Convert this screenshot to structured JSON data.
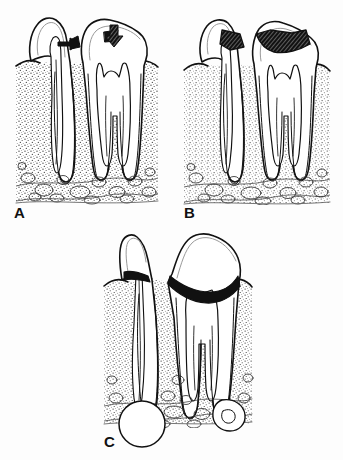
{
  "figure": {
    "background_color": "#fdfdfd",
    "line_color": "#111111",
    "caries_fill_color": "#111111",
    "bone_stipple_color": "#333333",
    "panels": [
      {
        "id": "A",
        "label": "A",
        "caption": "Incipient caries: shallow enamel and dentin lesions indicated by arrows; pulp chamber intact",
        "teeth_count": 2,
        "annotations": [
          {
            "name": "arrow-right",
            "direction": "right",
            "target": "interproximal-caries-lesion"
          },
          {
            "name": "arrow-down",
            "direction": "down",
            "target": "occlusal-caries-lesion"
          }
        ],
        "features": [
          "enamel-outline",
          "dentin-layer",
          "pulp-chamber",
          "root-canal",
          "periodontal-ligament-space",
          "alveolar-crestal-bone",
          "trabecular-bone"
        ]
      },
      {
        "id": "B",
        "label": "B",
        "caption": "Advanced caries: large carious lesions extend through dentin and approach or expose the pulp",
        "teeth_count": 2,
        "annotations": [],
        "features": [
          "large-interproximal-caries",
          "large-occlusal-caries",
          "pulp-chamber",
          "root-canal",
          "periodontal-ligament-space",
          "alveolar-crestal-bone",
          "trabecular-bone"
        ]
      },
      {
        "id": "C",
        "label": "C",
        "caption": "Gross coronal destruction with pulp necrosis and periapical radiolucencies (abscess/granuloma) at the root apices",
        "teeth_count": 2,
        "annotations": [],
        "features": [
          "gross-crown-destruction",
          "necrotic-pulp",
          "round-periapical-lesion",
          "irregular-periapical-lesion",
          "root-canal",
          "trabecular-bone"
        ]
      }
    ]
  }
}
